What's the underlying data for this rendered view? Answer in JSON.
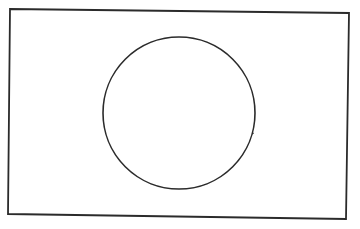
{
  "figure": {
    "title": "Rectangle with hatched circle",
    "width": 360,
    "height": 229,
    "background": "#ffffff",
    "stroke_color": "#2b2b2b",
    "hatch_color": "#3a3a3a",
    "frame": {
      "points": "10,9 349,13 346,219 8,214",
      "stroke_width": 1.8
    },
    "circle": {
      "cx": 179,
      "cy": 113,
      "r": 76,
      "stroke_width": 1.6
    },
    "hatch": {
      "stroke_width": 0.9,
      "lines": [
        {
          "x1": 117,
          "y1": 72,
          "x2": 178,
          "y2": 38
        },
        {
          "x1": 104,
          "y1": 104,
          "x2": 212,
          "y2": 46
        },
        {
          "x1": 106,
          "y1": 130,
          "x2": 236,
          "y2": 62
        },
        {
          "x1": 115,
          "y1": 153,
          "x2": 247,
          "y2": 81
        },
        {
          "x1": 133,
          "y1": 172,
          "x2": 255,
          "y2": 104
        },
        {
          "x1": 158,
          "y1": 184,
          "x2": 254,
          "y2": 133
        }
      ]
    }
  }
}
